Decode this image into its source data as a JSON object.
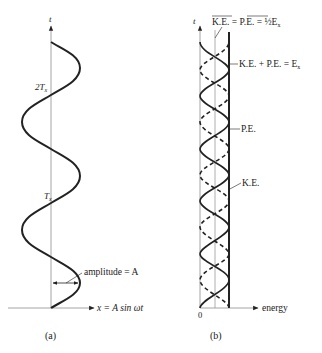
{
  "panel_a": {
    "caption": "(a)",
    "axis_t_label": "t",
    "axis_x_label": "x = A sin ωt",
    "tick_2T": "2T",
    "tick_2T_sub": "x",
    "tick_T": "T",
    "tick_T_sub": "x",
    "amplitude_label": "amplitude = A",
    "curve": {
      "periods": 2.5,
      "description": "sinusoid x = A sin ωt plotted with time vertical"
    }
  },
  "panel_b": {
    "caption": "(b)",
    "axis_t_label": "t",
    "axis_energy_label": "energy",
    "origin_label": "0",
    "avg_label_ke": "K.E.",
    "avg_label_eq1": "=",
    "avg_label_pe": "P.E.",
    "avg_label_eq2": "= ½E",
    "avg_label_sub": "x",
    "total_label": "K.E. + P.E. = E",
    "total_label_sub": "x",
    "pe_label": "P.E.",
    "ke_label": "K.E.",
    "curves": {
      "ke_style": "solid",
      "pe_style": "dashed",
      "total_style": "thick vertical line"
    }
  },
  "colors": {
    "ink": "#222222",
    "axis": "#9a9a9a",
    "background": "#ffffff"
  }
}
